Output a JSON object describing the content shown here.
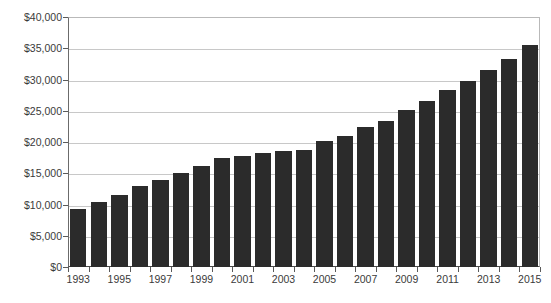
{
  "chart_data": {
    "type": "bar",
    "title": "",
    "subtitle": "",
    "xlabel": "",
    "ylabel": "",
    "categories": [
      "1993",
      "1994",
      "1995",
      "1996",
      "1997",
      "1998",
      "1999",
      "2000",
      "2001",
      "2002",
      "2003",
      "2004",
      "2005",
      "2006",
      "2007",
      "2008",
      "2009",
      "2010",
      "2011",
      "2012",
      "2013",
      "2014",
      "2015"
    ],
    "values": [
      9300,
      10400,
      11600,
      12900,
      14000,
      15100,
      16200,
      17500,
      17800,
      18300,
      18600,
      18800,
      20100,
      21000,
      22400,
      23400,
      25100,
      26500,
      28300,
      29800,
      31500,
      33300,
      35600
    ],
    "ylim": [
      0,
      40000
    ],
    "ytick_values": [
      0,
      5000,
      10000,
      15000,
      20000,
      25000,
      30000,
      35000,
      40000
    ],
    "ytick_labels": [
      "$0",
      "$5,000",
      "$10,000",
      "$15,000",
      "$20,000",
      "$25,000",
      "$30,000",
      "$35,000",
      "$40,000"
    ],
    "xtick_labels": [
      "1993",
      "1995",
      "1997",
      "1999",
      "2001",
      "2003",
      "2005",
      "2007",
      "2009",
      "2011",
      "2013",
      "2015"
    ],
    "xtick_label_categories": [
      "1993",
      "1995",
      "1997",
      "1999",
      "2001",
      "2003",
      "2005",
      "2007",
      "2009",
      "2011",
      "2013",
      "2015"
    ],
    "grid": true,
    "grid_axis": "y",
    "legend": false,
    "legend_position": "none",
    "bar_color": "#2b2b2b",
    "grid_color": "#c8c8c8",
    "axis_color": "#4a4a4a",
    "background_color": "#ffffff",
    "text_color": "#3a3a3a"
  }
}
